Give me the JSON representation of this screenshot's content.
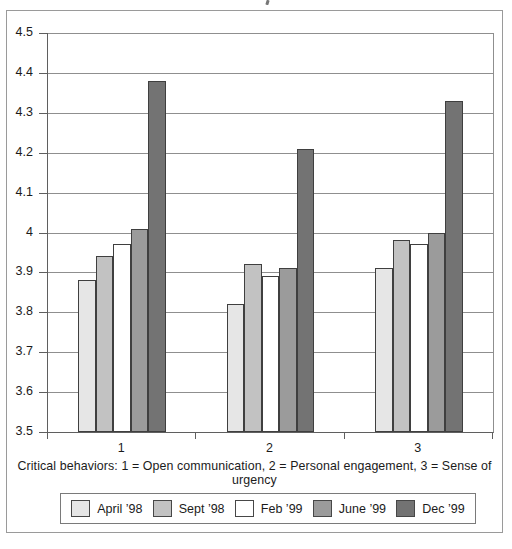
{
  "page": {
    "background": "#ffffff",
    "frame_border_color": "#9a9a9a",
    "cropped_title_fragment": ","
  },
  "chart_data": {
    "type": "bar",
    "categories": [
      "1",
      "2",
      "3"
    ],
    "series": [
      {
        "name": "April ’98",
        "color": "#e6e6e6",
        "values": [
          3.88,
          3.82,
          3.91
        ]
      },
      {
        "name": "Sept ’98",
        "color": "#c2c2c2",
        "values": [
          3.94,
          3.92,
          3.98
        ]
      },
      {
        "name": "Feb ’99",
        "color": "#ffffff",
        "values": [
          3.97,
          3.89,
          3.97
        ]
      },
      {
        "name": "June ’99",
        "color": "#9b9b9b",
        "values": [
          4.01,
          3.91,
          4.0
        ]
      },
      {
        "name": "Dec ’99",
        "color": "#737373",
        "values": [
          4.38,
          4.21,
          4.33
        ]
      }
    ],
    "title": "",
    "xlabel": "",
    "ylabel": "",
    "ylim": [
      3.5,
      4.5
    ],
    "ytick_step": 0.1,
    "ytick_labels": [
      "4.5",
      "4.4",
      "4.3",
      "4.2",
      "4.1",
      "4",
      "3.9",
      "3.8",
      "3.7",
      "3.6",
      "3.5"
    ],
    "grid": true,
    "legend_position": "bottom",
    "caption": "Critical behaviors: 1 = Open communication, 2 = Personal engagement, 3 = Sense of urgency",
    "gridline_color": "#8f8f8f",
    "axis_color": "#5f5f5f",
    "bar_border_color": "#3f3f3f"
  }
}
